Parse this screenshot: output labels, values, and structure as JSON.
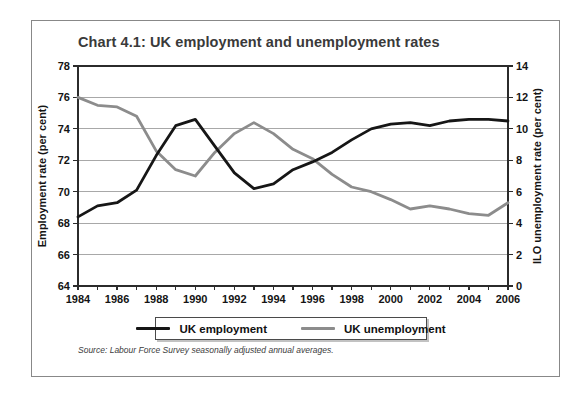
{
  "title": "Chart 4.1: UK employment and unemployment rates",
  "source": "Source: Labour Force Survey seasonally adjusted annual averages.",
  "legend": {
    "entries": [
      {
        "label": "UK employment"
      },
      {
        "label": "UK unemployment"
      }
    ]
  },
  "chart_data": {
    "type": "line",
    "title": "Chart 4.1: UK employment and unemployment rates",
    "x": [
      1984,
      1985,
      1986,
      1987,
      1988,
      1989,
      1990,
      1991,
      1992,
      1993,
      1994,
      1995,
      1996,
      1997,
      1998,
      1999,
      2000,
      2001,
      2002,
      2003,
      2004,
      2005,
      2006
    ],
    "x_tick_labels": [
      1984,
      1986,
      1988,
      1990,
      1992,
      1994,
      1996,
      1998,
      2000,
      2002,
      2004,
      2006
    ],
    "series": [
      {
        "name": "UK employment",
        "axis": "left",
        "color": "#161616",
        "values": [
          68.4,
          69.1,
          69.3,
          70.1,
          72.3,
          74.2,
          74.6,
          72.9,
          71.2,
          70.2,
          70.5,
          71.4,
          71.9,
          72.5,
          73.3,
          74.0,
          74.3,
          74.4,
          74.2,
          74.5,
          74.6,
          74.6,
          74.5
        ]
      },
      {
        "name": "UK unemployment",
        "axis": "right",
        "color": "#8c8c8c",
        "values": [
          12.0,
          11.5,
          11.4,
          10.8,
          8.6,
          7.4,
          7.0,
          8.5,
          9.7,
          10.4,
          9.7,
          8.7,
          8.1,
          7.1,
          6.3,
          6.0,
          5.5,
          4.9,
          5.1,
          4.9,
          4.6,
          4.5,
          5.3
        ]
      }
    ],
    "left_axis": {
      "label": "Employment rate (per cent)",
      "range": [
        64,
        78
      ],
      "ticks": [
        64,
        66,
        68,
        70,
        72,
        74,
        76,
        78
      ]
    },
    "right_axis": {
      "label": "ILO unemployment rate (per cent)",
      "range": [
        0,
        14
      ],
      "ticks": [
        0,
        2,
        4,
        6,
        8,
        10,
        12,
        14
      ]
    },
    "grid": true,
    "legend_position": "bottom",
    "colors": {
      "grid": "#a8a8a8",
      "axis": "#2b2b2b",
      "tick_text": "#141414"
    }
  }
}
